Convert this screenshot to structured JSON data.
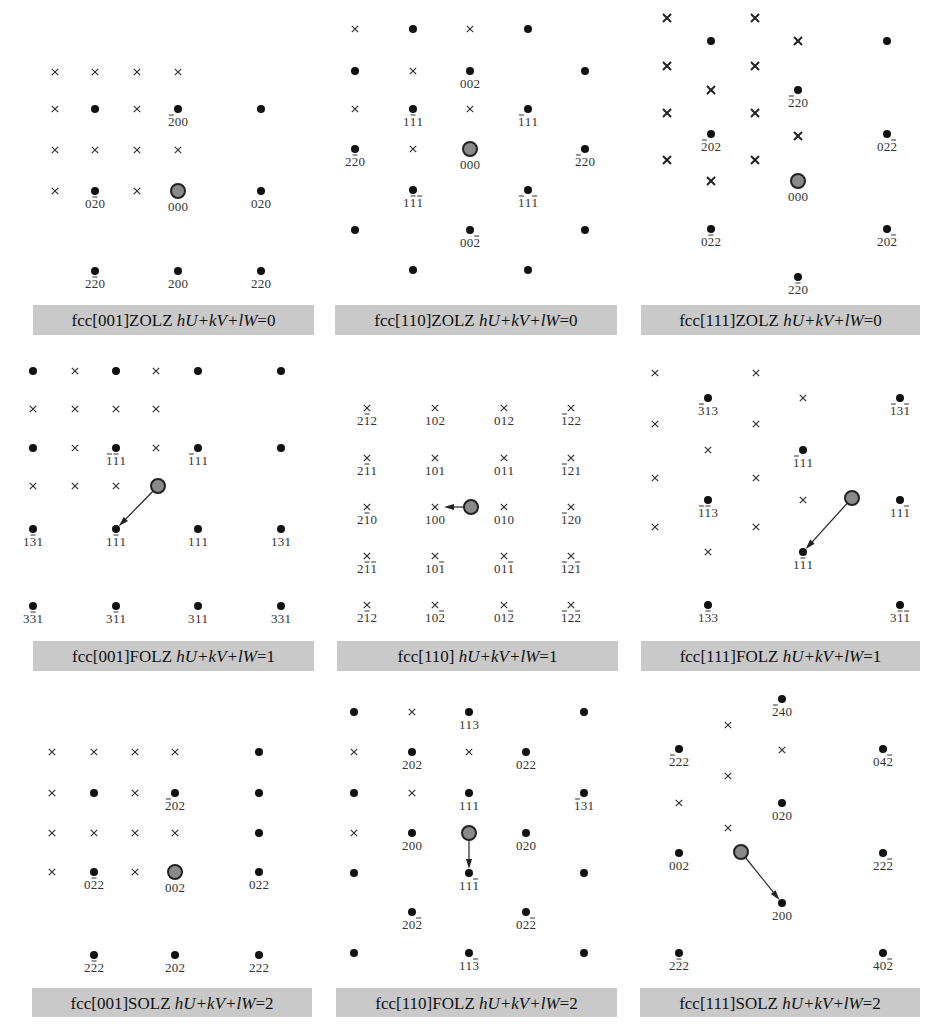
{
  "figure": {
    "panels": [
      {
        "id": "p1",
        "caption": {
          "prefix": "fcc[001]ZOLZ ",
          "formula": "hU+kV+lW",
          "suffix": "=0",
          "box": [
            33,
            305,
            281,
            30
          ]
        },
        "crosses": [
          [
            55,
            72
          ],
          [
            95,
            72
          ],
          [
            137,
            72
          ],
          [
            178,
            72
          ],
          [
            55,
            109
          ],
          [
            137,
            109
          ],
          [
            55,
            150
          ],
          [
            95,
            150
          ],
          [
            137,
            150
          ],
          [
            178,
            150
          ],
          [
            55,
            191
          ],
          [
            137,
            191
          ]
        ],
        "crosses_bold": false,
        "dots": [
          [
            95,
            109,
            ""
          ],
          [
            178,
            109,
            "-200"
          ],
          [
            261,
            109,
            ""
          ],
          [
            95,
            191,
            "0-20"
          ],
          [
            261,
            191,
            "020"
          ],
          [
            95,
            271,
            "2-20"
          ],
          [
            178,
            271,
            "200"
          ],
          [
            261,
            271,
            "220"
          ]
        ],
        "center": [
          178,
          191,
          "000"
        ],
        "arrow": null
      },
      {
        "id": "p2",
        "caption": {
          "prefix": "fcc[110]ZOLZ ",
          "formula": "hU+kV+lW",
          "suffix": "=0",
          "box": [
            335,
            305,
            282,
            30
          ]
        },
        "crosses": [
          [
            355,
            29
          ],
          [
            470,
            29
          ],
          [
            413,
            71
          ],
          [
            355,
            109
          ],
          [
            470,
            109
          ],
          [
            413,
            149
          ]
        ],
        "crosses_bold": false,
        "dots": [
          [
            413,
            29,
            ""
          ],
          [
            528,
            29,
            ""
          ],
          [
            355,
            71,
            ""
          ],
          [
            470,
            71,
            "002"
          ],
          [
            585,
            71,
            ""
          ],
          [
            413,
            109,
            "1-11"
          ],
          [
            528,
            109,
            "-111"
          ],
          [
            355,
            149,
            "2-20"
          ],
          [
            585,
            149,
            "-220"
          ],
          [
            413,
            190,
            "1-1-1"
          ],
          [
            528,
            190,
            "-11-1"
          ],
          [
            355,
            230,
            ""
          ],
          [
            470,
            230,
            "00-2"
          ],
          [
            585,
            230,
            ""
          ],
          [
            413,
            270,
            ""
          ],
          [
            528,
            270,
            ""
          ]
        ],
        "center": [
          470,
          149,
          "000"
        ],
        "arrow": null
      },
      {
        "id": "p3",
        "caption": {
          "prefix": "fcc[111]ZOLZ ",
          "formula": "hU+kV+lW",
          "suffix": "=0",
          "box": [
            641,
            305,
            279,
            30
          ]
        },
        "crosses": [
          [
            667,
            18
          ],
          [
            755,
            18
          ],
          [
            798,
            41
          ],
          [
            667,
            66
          ],
          [
            755,
            66
          ],
          [
            711,
            90
          ],
          [
            667,
            113
          ],
          [
            755,
            113
          ],
          [
            798,
            136
          ],
          [
            667,
            160
          ],
          [
            755,
            160
          ],
          [
            711,
            181
          ]
        ],
        "crosses_bold": true,
        "dots": [
          [
            711,
            41,
            ""
          ],
          [
            887,
            41,
            ""
          ],
          [
            798,
            90,
            "-220"
          ],
          [
            711,
            134,
            "-202"
          ],
          [
            887,
            134,
            "02-2"
          ],
          [
            711,
            229,
            "0-22"
          ],
          [
            887,
            229,
            "20-2"
          ],
          [
            798,
            277,
            "2-20"
          ]
        ],
        "center": [
          798,
          181,
          "000"
        ],
        "arrow": null
      },
      {
        "id": "p4",
        "caption": {
          "prefix": "fcc[001]FOLZ ",
          "formula": "hU+kV+lW",
          "suffix": "=1",
          "box": [
            33,
            641,
            281,
            30
          ]
        },
        "crosses": [
          [
            75,
            371
          ],
          [
            156,
            371
          ],
          [
            33,
            409
          ],
          [
            75,
            409
          ],
          [
            116,
            409
          ],
          [
            156,
            409
          ],
          [
            75,
            448
          ],
          [
            156,
            448
          ],
          [
            33,
            486
          ],
          [
            75,
            486
          ],
          [
            116,
            486
          ]
        ],
        "crosses_bold": false,
        "dots": [
          [
            33,
            371,
            ""
          ],
          [
            116,
            371,
            ""
          ],
          [
            198,
            371,
            ""
          ],
          [
            281,
            371,
            ""
          ],
          [
            33,
            448,
            ""
          ],
          [
            116,
            448,
            "-1-11"
          ],
          [
            198,
            448,
            "-111"
          ],
          [
            281,
            448,
            ""
          ],
          [
            33,
            529,
            "1-31"
          ],
          [
            116,
            529,
            "1-11"
          ],
          [
            198,
            529,
            "111"
          ],
          [
            281,
            529,
            "131"
          ],
          [
            33,
            606,
            "3-31"
          ],
          [
            116,
            606,
            "3-11"
          ],
          [
            198,
            606,
            "311"
          ],
          [
            281,
            606,
            "331"
          ]
        ],
        "center": [
          158,
          486,
          ""
        ],
        "arrow": [
          158,
          486,
          116,
          529
        ]
      },
      {
        "id": "p5",
        "caption": {
          "prefix": "fcc[110] ",
          "formula": "hU+kV+lW",
          "suffix": "=1",
          "box": [
            337,
            641,
            281,
            30
          ]
        },
        "crosses": [
          [
            367,
            408,
            "2-12"
          ],
          [
            435,
            408,
            "102"
          ],
          [
            504,
            408,
            "012"
          ],
          [
            571,
            408,
            "-122"
          ],
          [
            367,
            458,
            "2-11"
          ],
          [
            435,
            458,
            "101"
          ],
          [
            504,
            458,
            "011"
          ],
          [
            571,
            458,
            "-121"
          ],
          [
            367,
            507,
            "2-10"
          ],
          [
            435,
            507,
            "100"
          ],
          [
            504,
            507,
            "010"
          ],
          [
            571,
            507,
            "-120"
          ],
          [
            367,
            556,
            "2-1-1"
          ],
          [
            435,
            556,
            "10-1"
          ],
          [
            504,
            556,
            "01-1"
          ],
          [
            571,
            556,
            "-12-1"
          ],
          [
            367,
            605,
            "2-12"
          ],
          [
            435,
            605,
            "10-2"
          ],
          [
            504,
            605,
            "01-2"
          ],
          [
            571,
            605,
            "-12-2"
          ]
        ],
        "crosses_bold": false,
        "dots": [],
        "center": [
          471,
          507,
          ""
        ],
        "arrow": [
          471,
          507,
          440,
          507
        ]
      },
      {
        "id": "p6",
        "caption": {
          "prefix": "fcc[111]FOLZ ",
          "formula": "hU+kV+lW",
          "suffix": "=1",
          "box": [
            641,
            641,
            279,
            30
          ]
        },
        "crosses": [
          [
            655,
            373
          ],
          [
            756,
            373
          ],
          [
            803,
            398
          ],
          [
            655,
            424
          ],
          [
            756,
            424
          ],
          [
            708,
            450
          ],
          [
            655,
            478
          ],
          [
            756,
            478
          ],
          [
            803,
            500
          ],
          [
            655,
            527
          ],
          [
            756,
            527
          ],
          [
            708,
            552
          ]
        ],
        "crosses_bold": false,
        "dots": [
          [
            708,
            398,
            "-313"
          ],
          [
            900,
            398,
            "-13-1"
          ],
          [
            803,
            450,
            "-111"
          ],
          [
            708,
            500,
            "-1-13"
          ],
          [
            900,
            500,
            "11-1"
          ],
          [
            803,
            552,
            "1-11"
          ],
          [
            708,
            605,
            "1-33"
          ],
          [
            900,
            605,
            "3-1-1"
          ]
        ],
        "center": [
          852,
          498,
          ""
        ],
        "arrow": [
          852,
          498,
          803,
          552
        ]
      },
      {
        "id": "p7",
        "caption": {
          "prefix": "fcc[001]SOLZ ",
          "formula": "hU+kV+lW",
          "suffix": "=2",
          "box": [
            32,
            988,
            280,
            29
          ]
        },
        "crosses": [
          [
            52,
            752
          ],
          [
            94,
            752
          ],
          [
            135,
            752
          ],
          [
            175,
            752
          ],
          [
            52,
            793
          ],
          [
            135,
            793
          ],
          [
            52,
            833
          ],
          [
            94,
            833
          ],
          [
            135,
            833
          ],
          [
            175,
            833
          ],
          [
            52,
            872
          ],
          [
            135,
            872
          ]
        ],
        "crosses_bold": false,
        "dots": [
          [
            259,
            752,
            ""
          ],
          [
            94,
            793,
            ""
          ],
          [
            175,
            793,
            "-202"
          ],
          [
            259,
            793,
            ""
          ],
          [
            259,
            833,
            ""
          ],
          [
            94,
            872,
            "0-22"
          ],
          [
            259,
            872,
            "022"
          ],
          [
            94,
            955,
            "2-22"
          ],
          [
            175,
            955,
            "202"
          ],
          [
            259,
            955,
            "222"
          ]
        ],
        "center": [
          175,
          872,
          "002"
        ],
        "arrow": null
      },
      {
        "id": "p8",
        "caption": {
          "prefix": "fcc[110]FOLZ ",
          "formula": "hU+kV+lW",
          "suffix": "=2",
          "box": [
            336,
            988,
            281,
            29
          ]
        },
        "crosses": [
          [
            412,
            712
          ],
          [
            354,
            752
          ],
          [
            469,
            752
          ],
          [
            412,
            793
          ],
          [
            354,
            833
          ]
        ],
        "crosses_bold": false,
        "dots": [
          [
            354,
            712,
            ""
          ],
          [
            469,
            712,
            "113"
          ],
          [
            584,
            712,
            ""
          ],
          [
            412,
            752,
            "202"
          ],
          [
            526,
            752,
            "022"
          ],
          [
            354,
            793,
            ""
          ],
          [
            469,
            793,
            "111"
          ],
          [
            584,
            793,
            "-131"
          ],
          [
            412,
            833,
            "200"
          ],
          [
            526,
            833,
            "020"
          ],
          [
            354,
            873,
            ""
          ],
          [
            469,
            873,
            "11-1"
          ],
          [
            584,
            873,
            ""
          ],
          [
            412,
            912,
            "20-2"
          ],
          [
            526,
            912,
            "02-2"
          ],
          [
            354,
            953,
            ""
          ],
          [
            469,
            953,
            "11-3"
          ],
          [
            584,
            953,
            ""
          ]
        ],
        "center": [
          469,
          833,
          ""
        ],
        "arrow": [
          469,
          833,
          469,
          873
        ]
      },
      {
        "id": "p9",
        "caption": {
          "prefix": "fcc[111]SOLZ ",
          "formula": "hU+kV+lW",
          "suffix": "=2",
          "box": [
            640,
            988,
            280,
            29
          ]
        },
        "crosses": [
          [
            728,
            725
          ],
          [
            782,
            750
          ],
          [
            728,
            776
          ],
          [
            679,
            803
          ],
          [
            728,
            828
          ]
        ],
        "crosses_bold": false,
        "dots": [
          [
            782,
            699,
            "-240"
          ],
          [
            679,
            749,
            "-222"
          ],
          [
            883,
            749,
            "04-2"
          ],
          [
            782,
            803,
            "020"
          ],
          [
            679,
            853,
            "002"
          ],
          [
            883,
            853,
            "22-2"
          ],
          [
            782,
            903,
            "200"
          ],
          [
            679,
            953,
            "2-22"
          ],
          [
            883,
            953,
            "40-2"
          ]
        ],
        "center": [
          741,
          852,
          ""
        ],
        "arrow": [
          741,
          852,
          782,
          903
        ]
      }
    ],
    "legend": {
      "dot": "allowed reflection",
      "cross": "forbidden reflection",
      "big_circle": "transmitted beam / Laue center"
    },
    "colors": {
      "caption_bg": "#c9c9c9",
      "spot": "#111111",
      "center_fill": "#8a8a8a"
    }
  }
}
